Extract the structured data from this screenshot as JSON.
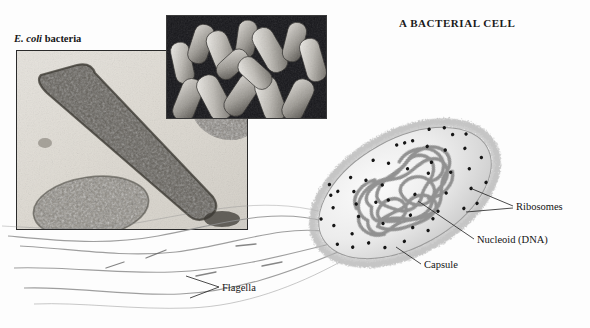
{
  "figure": {
    "title": "A BACTERIAL CELL",
    "background_color": "#fdfdfd",
    "text_color": "#141414"
  },
  "micrographs": [
    {
      "id": "tem",
      "caption_species": "E. coli",
      "caption_rest": " bacteria",
      "name": "tem-micrograph",
      "description": "transmission electron micrograph of a single rod-shaped bacterium"
    },
    {
      "id": "sem",
      "name": "sem-micrograph",
      "description": "scanning electron micrograph of clustered rod-shaped bacteria"
    }
  ],
  "diagram": {
    "name": "bacterial-cell-diagram",
    "cell_fill": "#e9e9e9",
    "structure_color": "#8a8a8a",
    "ribosome_color": "#151515",
    "labels": [
      {
        "key": "ribosomes",
        "text": "Ribosomes"
      },
      {
        "key": "nucleoid",
        "text": "Nucleoid (DNA)"
      },
      {
        "key": "capsule",
        "text": "Capsule"
      },
      {
        "key": "flagella",
        "text": "Flagella"
      }
    ]
  }
}
